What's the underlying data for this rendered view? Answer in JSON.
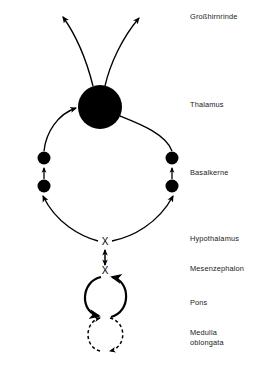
{
  "figure": {
    "background_color": "#ffffff",
    "ink_color": "#000000",
    "label_color": "#1a1a1a"
  },
  "labels": [
    {
      "id": "cortex",
      "text": "Großhirnrinde",
      "x": 190,
      "y": 19
    },
    {
      "id": "thalamus",
      "text": "Thalamus",
      "x": 190,
      "y": 107
    },
    {
      "id": "basal_ganglia",
      "text": "Basalkerne",
      "x": 190,
      "y": 175
    },
    {
      "id": "hypothalamus",
      "text": "Hypothalamus",
      "x": 190,
      "y": 241
    },
    {
      "id": "mesencephalon",
      "text": "Mesenzephalon",
      "x": 190,
      "y": 271
    },
    {
      "id": "pons",
      "text": "Pons",
      "x": 190,
      "y": 305
    },
    {
      "id": "medulla_line1",
      "text": "Medulla",
      "x": 190,
      "y": 335
    },
    {
      "id": "medulla_line2",
      "text": "oblongata",
      "x": 190,
      "y": 345
    }
  ],
  "nodes": {
    "thalamus_circle": {
      "cx": 100,
      "cy": 107,
      "r": 22,
      "filled": true
    },
    "basal_dots": [
      {
        "id": "left-upper",
        "cx": 44,
        "cy": 158,
        "r": 6.5,
        "filled": true
      },
      {
        "id": "left-lower",
        "cx": 44,
        "cy": 186,
        "r": 6.5,
        "filled": true
      },
      {
        "id": "right-upper",
        "cx": 172,
        "cy": 158,
        "r": 6.5,
        "filled": true
      },
      {
        "id": "right-lower",
        "cx": 172,
        "cy": 186,
        "r": 6.5,
        "filled": true
      }
    ]
  },
  "crossings": [
    {
      "id": "hypothalamus-crossing",
      "symbol": "X",
      "x": 105,
      "y": 242
    },
    {
      "id": "mesencephalon-crossing",
      "symbol": "X",
      "x": 105,
      "y": 271
    }
  ],
  "loops": [
    {
      "id": "pons-loop",
      "cx": 106,
      "cy": 296,
      "r": 21,
      "style": "solid",
      "bidirectional": true
    },
    {
      "id": "medulla-loop",
      "cx": 106,
      "cy": 334,
      "r": 18,
      "style": "dashed",
      "bidirectional": true
    }
  ],
  "connections": [
    {
      "id": "thalamus-to-cortex-left",
      "from": "thalamus",
      "to": "cortex",
      "arrow": "end"
    },
    {
      "id": "thalamus-to-cortex-right",
      "from": "thalamus",
      "to": "cortex",
      "arrow": "end"
    },
    {
      "id": "basal-left-to-thalamus",
      "from": "basal-left-upper",
      "to": "thalamus",
      "arrow": "end"
    },
    {
      "id": "thalamus-to-basal-right",
      "from": "thalamus",
      "to": "basal-right-upper",
      "arrow": "none"
    },
    {
      "id": "basal-left-internal",
      "from": "basal-left-lower",
      "to": "basal-left-upper",
      "arrow": "end"
    },
    {
      "id": "basal-right-internal",
      "from": "basal-right-lower",
      "to": "basal-right-upper",
      "arrow": "end"
    },
    {
      "id": "hypothalamus-to-basal-left",
      "from": "hypothalamus-crossing",
      "to": "basal-left-lower",
      "arrow": "end"
    },
    {
      "id": "hypothalamus-to-basal-right",
      "from": "hypothalamus-crossing",
      "to": "basal-right-lower",
      "arrow": "end"
    },
    {
      "id": "hypothalamus-mesencephalon",
      "from": "hypothalamus-crossing",
      "to": "mesencephalon-crossing",
      "arrow": "both"
    }
  ]
}
